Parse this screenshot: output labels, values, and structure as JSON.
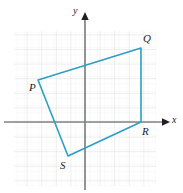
{
  "figure": {
    "background_color": "#ffffff"
  },
  "axes": {
    "x_label": "x",
    "y_label": "y",
    "axis_color": "#808285",
    "origin_px": {
      "x": 85,
      "y": 122
    },
    "unit_px": 14.6,
    "x_range": [
      -4.9,
      4.8
    ],
    "y_range": [
      -4.3,
      6.3
    ],
    "arrows": [
      "x-positive",
      "y-positive"
    ]
  },
  "grid": {
    "major_color": "#d9dadb",
    "minor_color": "#eceded",
    "minor_per_major": 2,
    "major_spacing_px": 14.6,
    "left_px": 14,
    "right_px": 156,
    "top_px": 31,
    "bottom_px": 186,
    "visible": true
  },
  "shape": {
    "name": "quadrilateral-PQRS",
    "stroke_color": "#2b9fc4",
    "stroke_width_px": 1.6,
    "fill": "none",
    "closed": true,
    "vertices": [
      {
        "label": "P",
        "x": -3.2,
        "y": 2.9,
        "px": 38,
        "py": 80,
        "label_px": 29,
        "label_py": 82
      },
      {
        "label": "Q",
        "x": 3.8,
        "y": 5.1,
        "px": 141,
        "py": 48,
        "label_px": 143,
        "label_py": 33
      },
      {
        "label": "R",
        "x": 3.8,
        "y": 0.0,
        "px": 141,
        "py": 122,
        "label_px": 142,
        "label_py": 126
      },
      {
        "label": "S",
        "x": -1.2,
        "y": -2.3,
        "px": 68,
        "py": 156,
        "label_px": 60,
        "label_py": 160
      }
    ],
    "edges": [
      "PQ",
      "QR",
      "RS",
      "SP"
    ]
  },
  "labels": {
    "y_axis": "y",
    "x_axis": "x",
    "vertex_P": "P",
    "vertex_Q": "Q",
    "vertex_R": "R",
    "vertex_S": "S"
  }
}
